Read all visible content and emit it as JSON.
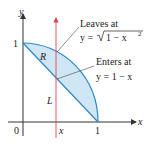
{
  "diagram": {
    "axes": {
      "x_label": "x",
      "y_label": "y",
      "origin_label": "0",
      "x_tick_label": "1",
      "y_tick_label": "1",
      "x_marker_label": "x"
    },
    "region_labels": {
      "region": "R",
      "line": "L"
    },
    "annotations": {
      "leaves_title": "Leaves at",
      "leaves_eq_prefix": "y = ",
      "leaves_eq_radicand": "1 − x",
      "leaves_eq_exp": "2",
      "enters_title": "Enters at",
      "enters_eq": "y = 1 − x"
    },
    "colors": {
      "region_fill": "#cfe6f4",
      "boundary": "#2b87c8",
      "vertical_line": "#e0444e",
      "axis": "#333333"
    }
  }
}
